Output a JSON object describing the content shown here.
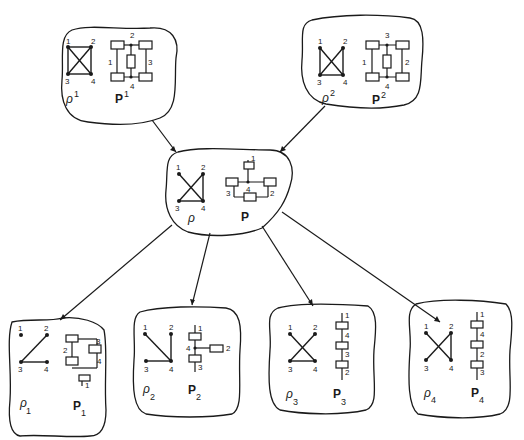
{
  "diagram": {
    "top_left": {
      "graph_label": "ρ",
      "graph_sup": "1",
      "net_label": "P",
      "net_sup": "1",
      "graph_nodes": [
        "1",
        "2",
        "3",
        "4"
      ],
      "net_nodes": [
        "1",
        "2",
        "3",
        "4"
      ]
    },
    "top_right": {
      "graph_label": "ρ",
      "graph_sup": "2",
      "net_label": "P",
      "net_sup": "2",
      "graph_nodes": [
        "1",
        "2",
        "3",
        "4"
      ],
      "net_nodes": [
        "1",
        "2",
        "3",
        "4"
      ]
    },
    "center": {
      "graph_label": "ρ",
      "net_label": "P",
      "graph_nodes": [
        "1",
        "2",
        "3",
        "4"
      ],
      "net_nodes": [
        "1",
        "2",
        "3",
        "4"
      ]
    },
    "bottom": [
      {
        "graph_label": "ρ",
        "graph_sub": "1",
        "net_label": "P",
        "net_sub": "1",
        "graph_nodes": [
          "1",
          "2",
          "3",
          "4"
        ],
        "net_nodes": [
          "1",
          "2",
          "3",
          "4"
        ]
      },
      {
        "graph_label": "ρ",
        "graph_sub": "2",
        "net_label": "P",
        "net_sub": "2",
        "graph_nodes": [
          "1",
          "2",
          "3",
          "4"
        ],
        "net_nodes": [
          "1",
          "2",
          "3",
          "4"
        ]
      },
      {
        "graph_label": "ρ",
        "graph_sub": "3",
        "net_label": "P",
        "net_sub": "3",
        "graph_nodes": [
          "1",
          "2",
          "3",
          "4"
        ],
        "net_nodes": [
          "1",
          "4",
          "3",
          "2"
        ]
      },
      {
        "graph_label": "ρ",
        "graph_sub": "4",
        "net_label": "P",
        "net_sub": "4",
        "graph_nodes": [
          "1",
          "2",
          "3",
          "4"
        ],
        "net_nodes": [
          "1",
          "4",
          "2",
          "3"
        ]
      }
    ]
  }
}
